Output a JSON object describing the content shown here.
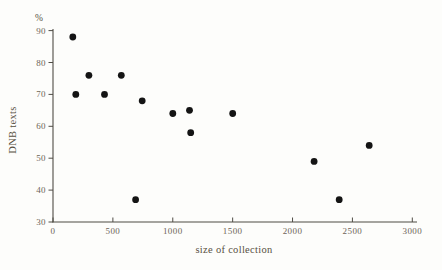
{
  "figure": {
    "kind": "scanned-book-scatter-plot"
  },
  "colors": {
    "background": "#fdfdfb",
    "axis": "#4f4c45",
    "tick_label": "#6d6457",
    "title_text": "#57503f",
    "point": "#141414"
  },
  "chart_data": {
    "type": "scatter",
    "title": "",
    "xlabel": "size of collection",
    "ylabel": "DNB texts",
    "y_unit": "%",
    "xlim": [
      0,
      3000
    ],
    "ylim": [
      30,
      90
    ],
    "x_ticks": [
      0,
      500,
      1000,
      1500,
      2000,
      2500,
      3000
    ],
    "y_ticks": [
      30,
      40,
      50,
      60,
      70,
      80,
      90
    ],
    "grid": false,
    "legend": false,
    "marker": {
      "shape": "circle",
      "color": "#141414",
      "radius_px": 3.4
    },
    "points": [
      {
        "x": 165,
        "y": 88
      },
      {
        "x": 190,
        "y": 70
      },
      {
        "x": 300,
        "y": 76
      },
      {
        "x": 430,
        "y": 70
      },
      {
        "x": 570,
        "y": 76
      },
      {
        "x": 690,
        "y": 37
      },
      {
        "x": 745,
        "y": 68
      },
      {
        "x": 1000,
        "y": 64
      },
      {
        "x": 1140,
        "y": 65
      },
      {
        "x": 1150,
        "y": 58
      },
      {
        "x": 1500,
        "y": 64
      },
      {
        "x": 2180,
        "y": 49
      },
      {
        "x": 2390,
        "y": 37
      },
      {
        "x": 2640,
        "y": 54
      }
    ]
  }
}
